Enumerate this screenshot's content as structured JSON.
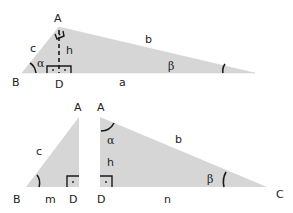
{
  "colors": {
    "fill": "#d6d6d6",
    "stroke": "#1a1a1a",
    "text": "#222222"
  },
  "diagram": {
    "top_triangle": {
      "vertices": {
        "A": "A",
        "B": "B",
        "C": "",
        "D": "D"
      },
      "sides": {
        "a": "a",
        "b": "b",
        "c": "c",
        "h": "h"
      },
      "angles": {
        "alpha": "α",
        "beta": "β"
      },
      "right_angle_marks": 3
    },
    "bottom_left_triangle": {
      "vertices": {
        "A": "A",
        "B": "B",
        "D": "D"
      },
      "sides": {
        "c": "c",
        "m": "m"
      },
      "angles": {
        "beta_arc": ""
      },
      "right_angle_marks": 1
    },
    "bottom_right_triangle": {
      "vertices": {
        "A": "A",
        "D": "D",
        "C": "C"
      },
      "sides": {
        "b": "b",
        "h": "h",
        "n": "n"
      },
      "angles": {
        "alpha": "α",
        "beta": "β"
      },
      "right_angle_marks": 1
    }
  }
}
